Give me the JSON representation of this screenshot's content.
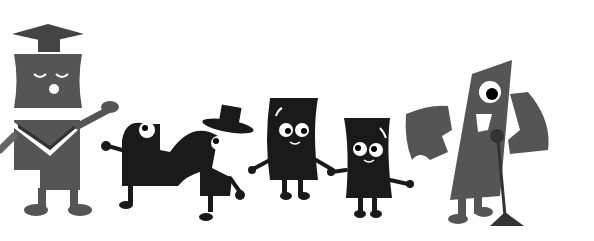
{
  "illustration": {
    "description": "Grayscale cartoon doodle of letter-shaped characters",
    "characters": [
      {
        "name": "graduate-G",
        "accessory": "mortarboard cap",
        "expression": "eyes closed, singing"
      },
      {
        "name": "serpentine-o-left",
        "expression": "one eye looking up"
      },
      {
        "name": "serpentine-o-right",
        "accessory": "top hat"
      },
      {
        "name": "paper-character-1",
        "expression": "smiling"
      },
      {
        "name": "paper-character-2",
        "expression": "smiling"
      },
      {
        "name": "one-eyed-l",
        "accessory": "microphone stand",
        "flanking": "two bracket shapes"
      }
    ]
  },
  "colors": {
    "background": "#ffffff",
    "gray": "#555555",
    "dark": "#1a1a1a",
    "white": "#ffffff"
  }
}
